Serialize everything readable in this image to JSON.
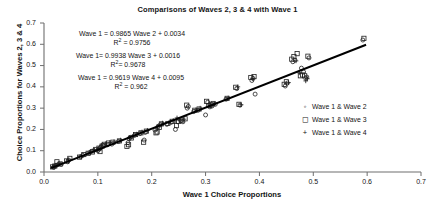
{
  "chart_data": {
    "type": "scatter",
    "title": "Comparisons of Waves 2, 3 & 4 with Wave 1",
    "xlabel": "Wave 1 Choice Proportions",
    "ylabel": "Choice Proportions for Waves 2, 3 & 4",
    "xlim": [
      0.0,
      0.7
    ],
    "ylim": [
      0.0,
      0.7
    ],
    "xticks": [
      "0.0",
      "0.1",
      "0.2",
      "0.3",
      "0.4",
      "0.5",
      "0.6",
      "0.7"
    ],
    "yticks": [
      "0.0",
      "0.1",
      "0.2",
      "0.3",
      "0.4",
      "0.5",
      "0.6",
      "0.7"
    ],
    "grid": false,
    "legend_position": "right-middle",
    "legend": [
      {
        "marker": "circle-marker",
        "glyph": "◦",
        "label": "Wave 1 & Wave 2"
      },
      {
        "marker": "square-marker",
        "glyph": "◻",
        "label": "Wave 1 & Wave 3"
      },
      {
        "marker": "plus-marker",
        "glyph": "+",
        "label": "Wave 1 & Wave 4"
      }
    ],
    "annotations": [
      {
        "equation": "Wave 1 = 0.9865 Wave 2 + 0.0034",
        "r2_prefix": "R",
        "r2_exp": "2",
        "r2_value": "= 0.9756"
      },
      {
        "equation": "Wave 1= 0.9938 Wave 3 + 0.0016",
        "r2_prefix": "R",
        "r2_exp": "2",
        "r2_value": "= 0.9678"
      },
      {
        "equation": "Wave 1 = 0.9619 Wave 4 + 0.0095",
        "r2_prefix": "R",
        "r2_exp": "2",
        "r2_value": "= 0.962"
      }
    ],
    "trendline": {
      "x0": 0.013,
      "y0": 0.018,
      "x1": 0.598,
      "y1": 0.598,
      "color": "#000000"
    },
    "series": [
      {
        "name": "Wave 1 & Wave 2",
        "marker": "circle",
        "points": [
          [
            0.018,
            0.022
          ],
          [
            0.022,
            0.03
          ],
          [
            0.026,
            0.035
          ],
          [
            0.032,
            0.036
          ],
          [
            0.044,
            0.048
          ],
          [
            0.046,
            0.056
          ],
          [
            0.068,
            0.072
          ],
          [
            0.072,
            0.078
          ],
          [
            0.084,
            0.09
          ],
          [
            0.088,
            0.097
          ],
          [
            0.092,
            0.1
          ],
          [
            0.1,
            0.1
          ],
          [
            0.103,
            0.108
          ],
          [
            0.106,
            0.118
          ],
          [
            0.11,
            0.124
          ],
          [
            0.118,
            0.128
          ],
          [
            0.126,
            0.131
          ],
          [
            0.138,
            0.143
          ],
          [
            0.156,
            0.138
          ],
          [
            0.158,
            0.156
          ],
          [
            0.16,
            0.163
          ],
          [
            0.168,
            0.172
          ],
          [
            0.178,
            0.18
          ],
          [
            0.186,
            0.15
          ],
          [
            0.188,
            0.186
          ],
          [
            0.206,
            0.197
          ],
          [
            0.212,
            0.215
          ],
          [
            0.216,
            0.222
          ],
          [
            0.228,
            0.224
          ],
          [
            0.236,
            0.233
          ],
          [
            0.244,
            0.2
          ],
          [
            0.248,
            0.236
          ],
          [
            0.254,
            0.24
          ],
          [
            0.258,
            0.236
          ],
          [
            0.266,
            0.3
          ],
          [
            0.268,
            0.308
          ],
          [
            0.278,
            0.284
          ],
          [
            0.286,
            0.29
          ],
          [
            0.3,
            0.268
          ],
          [
            0.304,
            0.328
          ],
          [
            0.308,
            0.306
          ],
          [
            0.312,
            0.31
          ],
          [
            0.318,
            0.318
          ],
          [
            0.338,
            0.342
          ],
          [
            0.358,
            0.392
          ],
          [
            0.364,
            0.314
          ],
          [
            0.386,
            0.43
          ],
          [
            0.388,
            0.44
          ],
          [
            0.392,
            0.366
          ],
          [
            0.448,
            0.404
          ],
          [
            0.452,
            0.418
          ],
          [
            0.462,
            0.518
          ],
          [
            0.466,
            0.526
          ],
          [
            0.478,
            0.488
          ],
          [
            0.482,
            0.47
          ],
          [
            0.486,
            0.44
          ],
          [
            0.488,
            0.446
          ],
          [
            0.492,
            0.536
          ],
          [
            0.592,
            0.62
          ]
        ]
      },
      {
        "name": "Wave 1 & Wave 3",
        "marker": "square",
        "points": [
          [
            0.016,
            0.024
          ],
          [
            0.02,
            0.028
          ],
          [
            0.024,
            0.048
          ],
          [
            0.03,
            0.038
          ],
          [
            0.042,
            0.052
          ],
          [
            0.048,
            0.064
          ],
          [
            0.066,
            0.07
          ],
          [
            0.074,
            0.082
          ],
          [
            0.082,
            0.088
          ],
          [
            0.09,
            0.094
          ],
          [
            0.096,
            0.106
          ],
          [
            0.102,
            0.112
          ],
          [
            0.104,
            0.096
          ],
          [
            0.108,
            0.122
          ],
          [
            0.112,
            0.13
          ],
          [
            0.12,
            0.136
          ],
          [
            0.128,
            0.14
          ],
          [
            0.14,
            0.146
          ],
          [
            0.154,
            0.12
          ],
          [
            0.157,
            0.128
          ],
          [
            0.162,
            0.16
          ],
          [
            0.17,
            0.176
          ],
          [
            0.18,
            0.184
          ],
          [
            0.185,
            0.14
          ],
          [
            0.19,
            0.192
          ],
          [
            0.208,
            0.184
          ],
          [
            0.21,
            0.188
          ],
          [
            0.214,
            0.21
          ],
          [
            0.218,
            0.226
          ],
          [
            0.23,
            0.228
          ],
          [
            0.238,
            0.238
          ],
          [
            0.246,
            0.218
          ],
          [
            0.25,
            0.238
          ],
          [
            0.256,
            0.244
          ],
          [
            0.262,
            0.25
          ],
          [
            0.265,
            0.314
          ],
          [
            0.28,
            0.29
          ],
          [
            0.288,
            0.296
          ],
          [
            0.302,
            0.332
          ],
          [
            0.306,
            0.312
          ],
          [
            0.31,
            0.316
          ],
          [
            0.314,
            0.322
          ],
          [
            0.34,
            0.346
          ],
          [
            0.356,
            0.398
          ],
          [
            0.362,
            0.318
          ],
          [
            0.384,
            0.444
          ],
          [
            0.39,
            0.448
          ],
          [
            0.446,
            0.412
          ],
          [
            0.45,
            0.424
          ],
          [
            0.46,
            0.53
          ],
          [
            0.464,
            0.542
          ],
          [
            0.47,
            0.556
          ],
          [
            0.476,
            0.452
          ],
          [
            0.48,
            0.456
          ],
          [
            0.484,
            0.452
          ],
          [
            0.49,
            0.544
          ],
          [
            0.594,
            0.628
          ]
        ]
      },
      {
        "name": "Wave 1 & Wave 4",
        "marker": "plus",
        "points": [
          [
            0.017,
            0.026
          ],
          [
            0.021,
            0.032
          ],
          [
            0.028,
            0.04
          ],
          [
            0.045,
            0.058
          ],
          [
            0.07,
            0.074
          ],
          [
            0.086,
            0.092
          ],
          [
            0.094,
            0.104
          ],
          [
            0.101,
            0.11
          ],
          [
            0.107,
            0.126
          ],
          [
            0.114,
            0.133
          ],
          [
            0.122,
            0.138
          ],
          [
            0.13,
            0.142
          ],
          [
            0.142,
            0.15
          ],
          [
            0.159,
            0.158
          ],
          [
            0.164,
            0.166
          ],
          [
            0.172,
            0.178
          ],
          [
            0.182,
            0.188
          ],
          [
            0.192,
            0.196
          ],
          [
            0.211,
            0.206
          ],
          [
            0.22,
            0.23
          ],
          [
            0.232,
            0.232
          ],
          [
            0.24,
            0.242
          ],
          [
            0.247,
            0.254
          ],
          [
            0.252,
            0.244
          ],
          [
            0.26,
            0.248
          ],
          [
            0.282,
            0.292
          ],
          [
            0.29,
            0.3
          ],
          [
            0.308,
            0.314
          ],
          [
            0.316,
            0.32
          ],
          [
            0.342,
            0.348
          ],
          [
            0.36,
            0.4
          ],
          [
            0.366,
            0.316
          ],
          [
            0.388,
            0.438
          ],
          [
            0.454,
            0.42
          ],
          [
            0.468,
            0.522
          ],
          [
            0.474,
            0.466
          ],
          [
            0.486,
            0.428
          ],
          [
            0.489,
            0.438
          ]
        ]
      }
    ]
  }
}
